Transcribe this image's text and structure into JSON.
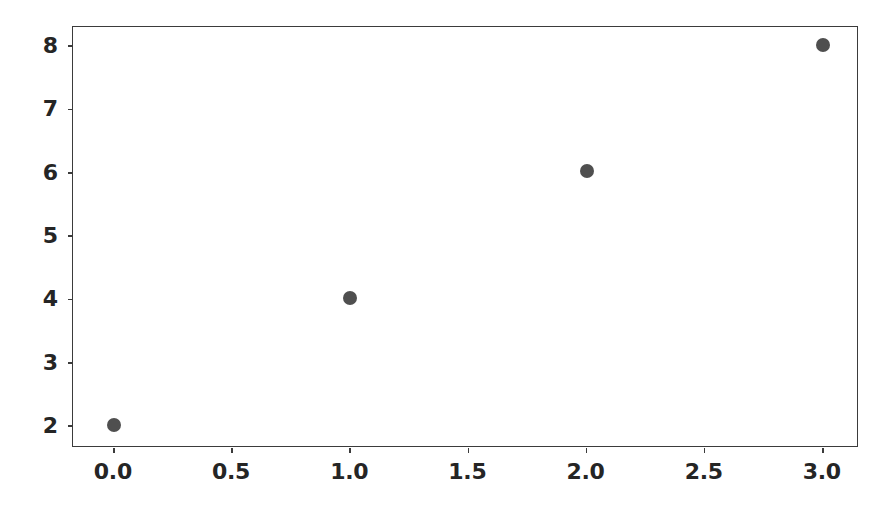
{
  "chart_data": {
    "type": "scatter",
    "title": "",
    "subtitle": "",
    "xlabel": "",
    "ylabel": "",
    "x": [
      0.0,
      1.0,
      2.0,
      3.0
    ],
    "values": [
      2.01,
      4.03,
      6.03,
      8.02
    ],
    "series": [
      {
        "name": "",
        "points": [
          {
            "x": 0.0,
            "y": 2.01
          },
          {
            "x": 1.0,
            "y": 4.03
          },
          {
            "x": 2.0,
            "y": 6.03
          },
          {
            "x": 3.0,
            "y": 8.02
          }
        ]
      }
    ],
    "xlim": [
      -0.173,
      3.153
    ],
    "ylim": [
      1.653,
      8.303
    ],
    "xticks": [
      0.0,
      0.5,
      1.0,
      1.5,
      2.0,
      2.5,
      3.0
    ],
    "yticks": [
      2,
      3,
      4,
      5,
      6,
      7,
      8
    ],
    "xtick_labels": [
      "0.0",
      "0.5",
      "1.0",
      "1.5",
      "2.0",
      "2.5",
      "3.0"
    ],
    "ytick_labels": [
      "2",
      "3",
      "4",
      "5",
      "6",
      "7",
      "8"
    ],
    "grid": false,
    "legend": null,
    "legend_position": "none",
    "annotations": [],
    "marker_color": "#4f4f4f",
    "marker_shape": "circle",
    "frame_color": "#3b3b3b",
    "background_color": "#ffffff",
    "tick_label_color": "#252525"
  }
}
